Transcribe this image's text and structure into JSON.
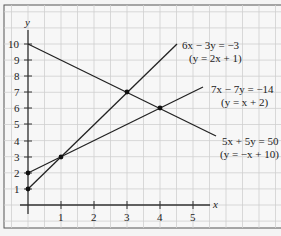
{
  "chart_data": {
    "type": "line",
    "title": "",
    "xlabel": "x",
    "ylabel": "y",
    "xlim": [
      0,
      5.7
    ],
    "ylim": [
      0,
      10
    ],
    "x_ticks": [
      "1",
      "2",
      "3",
      "4",
      "5"
    ],
    "y_ticks": [
      "1",
      "2",
      "3",
      "4",
      "5",
      "6",
      "7",
      "8",
      "9",
      "10"
    ],
    "grid": true,
    "series": [
      {
        "name": "6x − 3y = −3",
        "alt": "(y = 2x + 1)",
        "x": [
          0,
          4.5
        ],
        "y": [
          1,
          10
        ]
      },
      {
        "name": "7x − 7y = −14",
        "alt": "(y = x + 2)",
        "x": [
          0,
          5.3
        ],
        "y": [
          2,
          7.3
        ]
      },
      {
        "name": "5x + 5y = 50",
        "alt": "(y = −x + 10)",
        "x": [
          0,
          5.7
        ],
        "y": [
          10,
          4.3
        ]
      }
    ],
    "points": [
      {
        "x": 0,
        "y": 1
      },
      {
        "x": 0,
        "y": 2
      },
      {
        "x": 1,
        "y": 3
      },
      {
        "x": 3,
        "y": 7
      },
      {
        "x": 4,
        "y": 6
      }
    ],
    "annotations": [
      {
        "text": "6x − 3y = −3",
        "sub": "(y = 2x + 1)"
      },
      {
        "text": "7x − 7y = −14",
        "sub": "(y = x + 2)"
      },
      {
        "text": "5x + 5y = 50",
        "sub": "(y = −x + 10)"
      }
    ]
  },
  "labels": {
    "x_axis": "x",
    "y_axis": "y",
    "eq1": "6x − 3y = −3",
    "eq1_sub": "(y = 2x + 1)",
    "eq2": "7x − 7y = −14",
    "eq2_sub": "(y = x + 2)",
    "eq3": "5x + 5y = 50",
    "eq3_sub": "(y = −x + 10)",
    "xt1": "1",
    "xt2": "2",
    "xt3": "3",
    "xt4": "4",
    "xt5": "5",
    "yt1": "1",
    "yt2": "2",
    "yt3": "3",
    "yt4": "4",
    "yt5": "5",
    "yt6": "6",
    "yt7": "7",
    "yt8": "8",
    "yt9": "9",
    "yt10": "10"
  }
}
